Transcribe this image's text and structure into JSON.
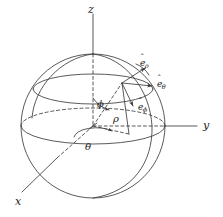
{
  "figure": {
    "background_color": "#ffffff",
    "stroke_color": "#3c3c3c",
    "text_color": "#1a1a1a"
  },
  "axes": [
    {
      "id": "z",
      "label": "z",
      "orientation": "vertical-up"
    },
    {
      "id": "y",
      "label": "y",
      "orientation": "horizontal-right"
    },
    {
      "id": "x",
      "label": "x",
      "orientation": "diagonal-down-left"
    }
  ],
  "angles": [
    {
      "id": "phi",
      "label": "ϕ",
      "description": "polar angle from z axis"
    },
    {
      "id": "theta",
      "label": "θ",
      "description": "azimuthal angle in xy plane from x axis"
    }
  ],
  "lengths": [
    {
      "id": "rho",
      "label": "ρ",
      "description": "radial distance from origin to point"
    }
  ],
  "unit_vectors": [
    {
      "id": "e_rho",
      "base": "e",
      "sub": "ρ",
      "hat": "ˆ",
      "description": "radial unit vector"
    },
    {
      "id": "e_theta",
      "base": "e",
      "sub": "θ",
      "hat": "ˆ",
      "description": "azimuthal unit vector"
    },
    {
      "id": "e_phi",
      "base": "e",
      "sub": "ϕ",
      "hat": "ˆ",
      "description": "polar unit vector"
    }
  ],
  "sphere": {
    "center": {
      "x": 93,
      "y": 126
    },
    "radius": 72,
    "equator_visible": true,
    "meridian_visible": true,
    "upper_latitude_visible": true
  },
  "point": {
    "x": 122,
    "y": 83,
    "label": ""
  }
}
